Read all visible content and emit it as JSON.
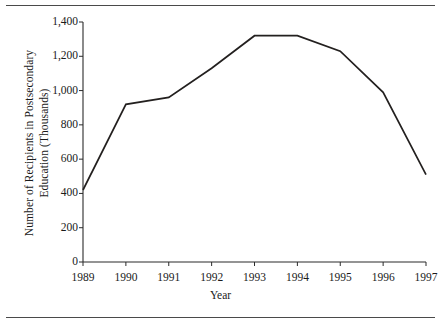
{
  "chart_data": {
    "type": "line",
    "title": "",
    "subtitle": "",
    "xlabel": "Year",
    "ylabel": "Number of Recipients in Postsecondary Education (Thousands)",
    "ylabel_line1": "Number of Recipients in Postsecondary",
    "ylabel_line2": "Education (Thousands)",
    "categories": [
      "1989",
      "1990",
      "1991",
      "1992",
      "1993",
      "1994",
      "1995",
      "1996",
      "1997"
    ],
    "x": [
      1989,
      1990,
      1991,
      1992,
      1993,
      1994,
      1995,
      1996,
      1997
    ],
    "values": [
      420,
      920,
      960,
      1130,
      1320,
      1320,
      1230,
      990,
      510
    ],
    "series": [
      {
        "name": "Number of Recipients in Postsecondary Education (Thousands)",
        "values": [
          420,
          920,
          960,
          1130,
          1320,
          1320,
          1230,
          990,
          510
        ]
      }
    ],
    "ylim": [
      0,
      1400
    ],
    "yticks": [
      0,
      200,
      400,
      600,
      800,
      1000,
      1200,
      1400
    ],
    "ytick_labels": [
      "0",
      "200",
      "400",
      "600",
      "800",
      "1,000",
      "1,200",
      "1,400"
    ],
    "xtick_labels": [
      "1989",
      "1990",
      "1991",
      "1992",
      "1993",
      "1994",
      "1995",
      "1996",
      "1997"
    ],
    "grid": false,
    "legend": false,
    "legend_position": "none",
    "line_color": "#23201f",
    "axis_color": "#2b2b2b",
    "background_color": "#ffffff"
  },
  "figure": {
    "top_rule": "",
    "bottom_rule": ""
  }
}
